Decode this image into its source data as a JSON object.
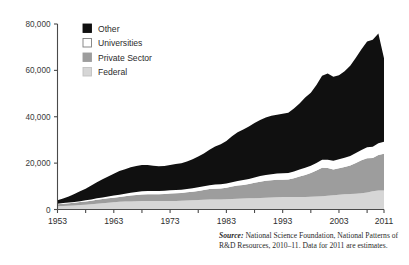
{
  "chart_data": {
    "type": "area",
    "stacked": true,
    "title": "",
    "xlabel": "",
    "ylabel": "",
    "xlim": [
      1953,
      2011
    ],
    "ylim": [
      0,
      80000
    ],
    "grid": false,
    "legend_position": "top-left",
    "y_ticks": [
      0,
      20000,
      40000,
      60000,
      80000
    ],
    "y_tick_labels": [
      "0",
      "20,000",
      "40,000",
      "60,000",
      "80,000"
    ],
    "x_ticks": [
      1953,
      1958,
      1963,
      1968,
      1973,
      1978,
      1983,
      1988,
      1993,
      1998,
      2003,
      2008,
      2011
    ],
    "x_tick_labels": [
      "1953",
      "1963",
      "1973",
      "1983",
      "1993",
      "2003",
      "2011"
    ],
    "x_labeled_ticks": [
      1953,
      1963,
      1973,
      1983,
      1993,
      2003,
      2011
    ],
    "x": [
      1953,
      1954,
      1955,
      1956,
      1957,
      1958,
      1959,
      1960,
      1961,
      1962,
      1963,
      1964,
      1965,
      1966,
      1967,
      1968,
      1969,
      1970,
      1971,
      1972,
      1973,
      1974,
      1975,
      1976,
      1977,
      1978,
      1979,
      1980,
      1981,
      1982,
      1983,
      1984,
      1985,
      1986,
      1987,
      1988,
      1989,
      1990,
      1991,
      1992,
      1993,
      1994,
      1995,
      1996,
      1997,
      1998,
      1999,
      2000,
      2001,
      2002,
      2003,
      2004,
      2005,
      2006,
      2007,
      2008,
      2009,
      2010,
      2011
    ],
    "series": [
      {
        "name": "Federal",
        "color": "#d6d6d6",
        "values": [
          1400,
          1500,
          1600,
          1700,
          1900,
          2100,
          2300,
          2500,
          2700,
          2900,
          3100,
          3300,
          3400,
          3500,
          3600,
          3700,
          3700,
          3700,
          3700,
          3700,
          3700,
          3700,
          3800,
          3900,
          4000,
          4100,
          4200,
          4300,
          4300,
          4300,
          4400,
          4500,
          4600,
          4700,
          4800,
          4900,
          5000,
          5100,
          5200,
          5300,
          5400,
          5400,
          5400,
          5400,
          5400,
          5500,
          5600,
          5700,
          5900,
          6100,
          6400,
          6600,
          6700,
          6800,
          7000,
          7300,
          7900,
          8200,
          8200
        ]
      },
      {
        "name": "Private Sector",
        "color": "#9d9d9d",
        "values": [
          900,
          1000,
          1100,
          1200,
          1300,
          1400,
          1500,
          1700,
          1800,
          1900,
          2000,
          2100,
          2300,
          2500,
          2700,
          2800,
          2900,
          2900,
          2900,
          3000,
          3200,
          3300,
          3300,
          3500,
          3700,
          3900,
          4200,
          4500,
          4700,
          4800,
          5000,
          5400,
          5700,
          5900,
          6200,
          6600,
          7000,
          7300,
          7400,
          7500,
          7400,
          7500,
          8100,
          8800,
          9500,
          10200,
          11200,
          12300,
          12000,
          11200,
          11400,
          11700,
          12300,
          13300,
          14200,
          14800,
          14300,
          15300,
          15800
        ]
      },
      {
        "name": "Universities",
        "color": "#ffffff",
        "values": [
          200,
          250,
          300,
          350,
          400,
          450,
          500,
          600,
          700,
          800,
          900,
          1000,
          1100,
          1200,
          1300,
          1400,
          1400,
          1400,
          1400,
          1400,
          1400,
          1400,
          1400,
          1450,
          1500,
          1550,
          1600,
          1700,
          1750,
          1800,
          1850,
          1900,
          2000,
          2100,
          2200,
          2300,
          2400,
          2500,
          2600,
          2700,
          2800,
          2800,
          2900,
          3000,
          3100,
          3200,
          3300,
          3500,
          3600,
          3700,
          3900,
          4000,
          4100,
          4300,
          4500,
          4700,
          4900,
          5100,
          5200
        ]
      },
      {
        "name": "Other",
        "color": "#101010",
        "values": [
          1500,
          2000,
          2600,
          3400,
          4300,
          5000,
          6000,
          7000,
          7800,
          8600,
          9400,
          10200,
          10600,
          11000,
          11200,
          11300,
          11200,
          10900,
          10700,
          10700,
          10900,
          11200,
          11400,
          11900,
          12500,
          13300,
          14200,
          15300,
          16400,
          17200,
          18300,
          19800,
          21000,
          21800,
          22600,
          23500,
          24200,
          24800,
          25200,
          25400,
          25700,
          26000,
          27200,
          28500,
          30300,
          31500,
          33600,
          36200,
          37200,
          36300,
          36200,
          37300,
          38900,
          41000,
          43400,
          45600,
          46100,
          47300,
          36000
        ]
      }
    ],
    "annotations": {
      "peak_note": "",
      "source_label": "Source:",
      "source_text": " National Science Foundation, National Patterns of R&D Resources, 2010–11. Data for 2011 are estimates."
    }
  },
  "legend": {
    "items": [
      {
        "label": "Other",
        "color": "#101010",
        "border": "#101010"
      },
      {
        "label": "Universities",
        "color": "#ffffff",
        "border": "#7d7d7d"
      },
      {
        "label": "Private Sector",
        "color": "#9d9d9d",
        "border": "#9d9d9d"
      },
      {
        "label": "Federal",
        "color": "#d6d6d6",
        "border": "#c2c2c2"
      }
    ]
  },
  "source": {
    "label": "Source:",
    "text": "National Science Foundation, National Patterns of R&D Resources, 2010–11. Data for 2011 are estimates."
  }
}
